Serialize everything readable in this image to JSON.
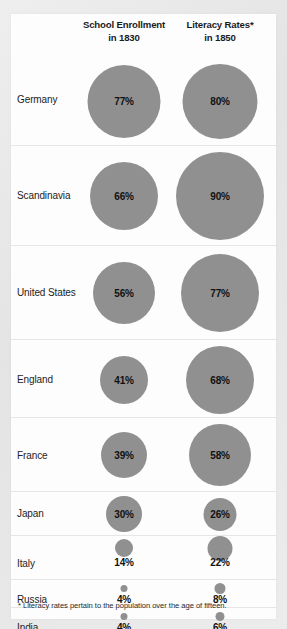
{
  "chart_data": {
    "type": "bar",
    "subtype": "bubble-matrix",
    "title": "",
    "xlabel": "",
    "ylabel": "",
    "categories": [
      "Germany",
      "Scandinavia",
      "United States",
      "England",
      "France",
      "Japan",
      "Italy",
      "Russia",
      "India"
    ],
    "series": [
      {
        "name": "School Enrollment in 1830",
        "values": [
          77,
          66,
          56,
          41,
          39,
          30,
          14,
          4,
          4
        ]
      },
      {
        "name": "Literacy Rates* in 1850",
        "values": [
          80,
          90,
          77,
          68,
          58,
          26,
          22,
          8,
          6
        ]
      }
    ],
    "value_labels": {
      "School Enrollment in 1830": [
        "77%",
        "66%",
        "56%",
        "41%",
        "39%",
        "30%",
        "14%",
        "4%",
        "4%"
      ],
      "Literacy Rates* in 1850": [
        "80%",
        "90%",
        "77%",
        "68%",
        "58%",
        "26%",
        "22%",
        "8%",
        "6%"
      ]
    },
    "units": "percent",
    "legend_position": "top",
    "grid": false,
    "annotations": [
      "* Literacy rates pertain to the population over the age of fifteen."
    ]
  },
  "header": {
    "columns": [
      {
        "line1": "School Enrollment",
        "line2": "in 1830"
      },
      {
        "line1": "Literacy Rates*",
        "line2": "in 1850"
      }
    ]
  },
  "rows": [
    {
      "label": "Germany",
      "enrollment": "77%",
      "literacy": "80%"
    },
    {
      "label": "Scandinavia",
      "enrollment": "66%",
      "literacy": "90%"
    },
    {
      "label": "United States",
      "enrollment": "56%",
      "literacy": "77%"
    },
    {
      "label": "England",
      "enrollment": "41%",
      "literacy": "68%"
    },
    {
      "label": "France",
      "enrollment": "39%",
      "literacy": "58%"
    },
    {
      "label": "Japan",
      "enrollment": "30%",
      "literacy": "26%"
    },
    {
      "label": "Italy",
      "enrollment": "14%",
      "literacy": "22%"
    },
    {
      "label": "Russia",
      "enrollment": "4%",
      "literacy": "8%"
    },
    {
      "label": "India",
      "enrollment": "4%",
      "literacy": "6%"
    }
  ],
  "footnote": {
    "text": "* Literacy rates pertain to the population over the age of fifteen."
  },
  "colors": {
    "bubble": "#909090",
    "card_background": "#fdfdfd",
    "page_background": "#e9e9e9",
    "divider": "#e6e6e6",
    "text": "#232323"
  }
}
